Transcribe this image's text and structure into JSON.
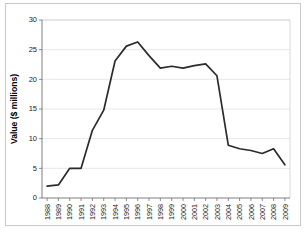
{
  "chart_data": {
    "type": "line",
    "title": "",
    "subtitle": "",
    "xlabel": "",
    "ylabel": "Value ($ millions)",
    "ylim": [
      0,
      30
    ],
    "yticks": [
      0,
      5,
      10,
      15,
      20,
      25,
      30
    ],
    "ytick_labels": [
      "0",
      "5",
      "10",
      "15",
      "20",
      "25",
      "30"
    ],
    "grid": "horizontal",
    "legend": "none",
    "line_color": "#2b2b2b",
    "categories": [
      "1988",
      "1989",
      "1990",
      "1991",
      "1992",
      "1993",
      "1994",
      "1995",
      "1996",
      "1997",
      "1998",
      "1999",
      "2000",
      "2001",
      "2002",
      "2003",
      "2004",
      "2005",
      "2006",
      "2007",
      "2008",
      "2009"
    ],
    "series": [
      {
        "name": "Value",
        "values": [
          2.0,
          2.2,
          5.0,
          5.0,
          11.4,
          14.8,
          23.1,
          25.6,
          26.3,
          24.0,
          21.9,
          22.2,
          21.9,
          22.3,
          22.6,
          20.6,
          8.9,
          8.3,
          8.0,
          7.5,
          8.3,
          5.6
        ]
      }
    ]
  },
  "figure": {
    "background_color": "#ffffff",
    "frame_color": "#c9c9c9",
    "grid_color": "#dcdcdc",
    "axis_color": "#6f6f6f"
  }
}
